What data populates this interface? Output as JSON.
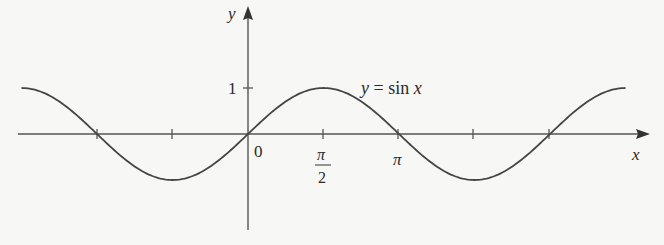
{
  "chart_data": {
    "type": "line",
    "title": "",
    "function_label": "y = sin x",
    "xlabel": "x",
    "ylabel": "y",
    "x_tick_labels": [
      "0",
      "π/2",
      "π"
    ],
    "y_tick_labels": [
      "1"
    ],
    "x_ticks": [
      -3.14159,
      -1.5708,
      0,
      1.5708,
      3.14159,
      4.71239,
      6.28319
    ],
    "y_ticks": [
      1
    ],
    "xlim": [
      -4.71239,
      7.85398
    ],
    "ylim": [
      -1,
      1
    ],
    "series": [
      {
        "name": "y = sin x",
        "x": [
          -4.7124,
          -3.927,
          -3.1416,
          -2.3562,
          -1.5708,
          -0.7854,
          0,
          0.7854,
          1.5708,
          2.3562,
          3.1416,
          3.927,
          4.7124,
          5.4978,
          6.2832,
          7.0686,
          7.854
        ],
        "values": [
          1,
          0.7071,
          0,
          -0.7071,
          -1,
          -0.7071,
          0,
          0.7071,
          1,
          0.7071,
          0,
          -0.7071,
          -1,
          -0.7071,
          0,
          0.7071,
          1
        ]
      }
    ],
    "grid": false,
    "legend": "none"
  },
  "labels": {
    "y_axis": "y",
    "x_axis": "x",
    "origin": "0",
    "one": "1",
    "pi_half_num": "π",
    "pi_half_den": "2",
    "pi": "π",
    "curve_y": "y",
    "curve_eq": " = sin ",
    "curve_x": "x"
  },
  "colors": {
    "curve": "#444444",
    "axis": "#555555",
    "background": "#f7f7f5"
  }
}
